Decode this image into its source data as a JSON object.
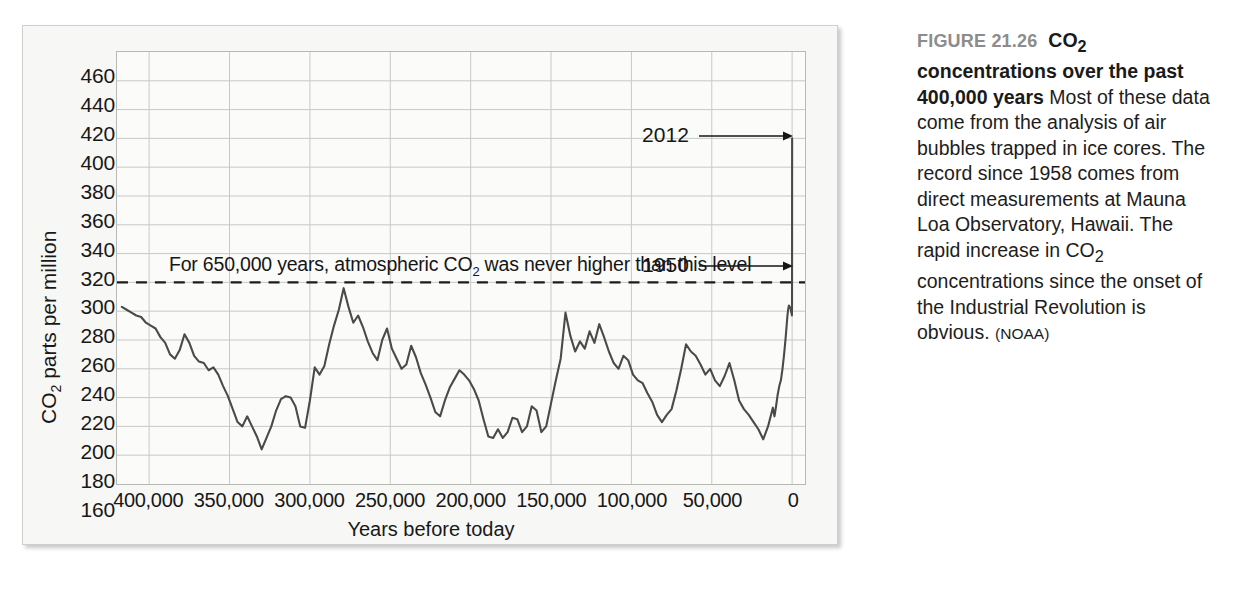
{
  "caption": {
    "figure_number": "FIGURE 21.26",
    "headline_part1": "CO",
    "headline_sub": "2",
    "headline_part2": " concentrations over the past 400,000 years",
    "body_part1": "Most of these data come from the analysis of air bubbles trapped in ice cores. The record since 1958 comes from direct measurements at Mauna Loa Observatory, Hawaii. The rapid increase in CO",
    "body_sub": "2",
    "body_part2": " concentrations since the onset of the Industrial Revolution is obvious.",
    "credit": "(NOAA)"
  },
  "chart_data": {
    "type": "line",
    "title": "",
    "xlabel": "Years before today",
    "ylabel_part1": "CO",
    "ylabel_sub": "2",
    "ylabel_part2": " parts per million",
    "xlim": [
      420000,
      -8000
    ],
    "ylim": [
      160,
      460
    ],
    "ytick_values": [
      460,
      440,
      420,
      400,
      380,
      360,
      340,
      320,
      300,
      280,
      260,
      240,
      220,
      200,
      180,
      160
    ],
    "ytick_labels": [
      "460",
      "440",
      "420",
      "400",
      "380",
      "360",
      "340",
      "320",
      "300",
      "280",
      "260",
      "240",
      "220",
      "200",
      "180",
      "160"
    ],
    "xtick_values": [
      400000,
      350000,
      300000,
      250000,
      200000,
      150000,
      100000,
      50000,
      0
    ],
    "xtick_labels": [
      "400,000",
      "350,000",
      "300,000",
      "250,000",
      "200,000",
      "150,000",
      "100,000",
      "50,000",
      "0"
    ],
    "grid": true,
    "line_color": "#4a4a4a",
    "threshold": {
      "value": 300,
      "style": "dashed",
      "label_part1": "For 650,000 years, atmospheric CO",
      "label_sub": "2",
      "label_part2": " was never higher than this level"
    },
    "annotations": [
      {
        "label": "2012",
        "y_value": 400,
        "x_value": 0
      },
      {
        "label": "1950",
        "y_value": 310,
        "x_value": 0
      }
    ],
    "series": [
      {
        "name": "CO2 concentration",
        "points": [
          [
            417000,
            283
          ],
          [
            414000,
            281
          ],
          [
            411000,
            279
          ],
          [
            408000,
            277
          ],
          [
            405000,
            276
          ],
          [
            402000,
            272
          ],
          [
            399000,
            270
          ],
          [
            396000,
            268
          ],
          [
            393000,
            262
          ],
          [
            390000,
            258
          ],
          [
            387000,
            250
          ],
          [
            384000,
            247
          ],
          [
            381000,
            253
          ],
          [
            378000,
            264
          ],
          [
            375000,
            258
          ],
          [
            372000,
            249
          ],
          [
            369000,
            245
          ],
          [
            366000,
            244
          ],
          [
            363000,
            239
          ],
          [
            360000,
            241
          ],
          [
            357000,
            236
          ],
          [
            354000,
            228
          ],
          [
            351000,
            221
          ],
          [
            348000,
            212
          ],
          [
            345000,
            203
          ],
          [
            342000,
            200
          ],
          [
            339000,
            207
          ],
          [
            336000,
            200
          ],
          [
            333000,
            193
          ],
          [
            330000,
            184
          ],
          [
            327000,
            192
          ],
          [
            324000,
            200
          ],
          [
            321000,
            211
          ],
          [
            318000,
            219
          ],
          [
            315000,
            221
          ],
          [
            312000,
            220
          ],
          [
            309000,
            214
          ],
          [
            306000,
            200
          ],
          [
            303000,
            199
          ],
          [
            300000,
            218
          ],
          [
            297000,
            241
          ],
          [
            294000,
            236
          ],
          [
            291000,
            242
          ],
          [
            288000,
            257
          ],
          [
            285000,
            270
          ],
          [
            282000,
            281
          ],
          [
            279000,
            296
          ],
          [
            276000,
            283
          ],
          [
            273000,
            272
          ],
          [
            270000,
            277
          ],
          [
            267000,
            269
          ],
          [
            264000,
            259
          ],
          [
            261000,
            251
          ],
          [
            258000,
            246
          ],
          [
            255000,
            260
          ],
          [
            252000,
            268
          ],
          [
            249000,
            254
          ],
          [
            246000,
            247
          ],
          [
            243000,
            240
          ],
          [
            240000,
            243
          ],
          [
            237000,
            256
          ],
          [
            234000,
            248
          ],
          [
            231000,
            237
          ],
          [
            228000,
            229
          ],
          [
            225000,
            220
          ],
          [
            222000,
            210
          ],
          [
            219000,
            207
          ],
          [
            216000,
            218
          ],
          [
            213000,
            227
          ],
          [
            210000,
            233
          ],
          [
            207000,
            239
          ],
          [
            204000,
            236
          ],
          [
            201000,
            232
          ],
          [
            198000,
            226
          ],
          [
            195000,
            218
          ],
          [
            192000,
            205
          ],
          [
            189000,
            193
          ],
          [
            186000,
            192
          ],
          [
            183000,
            198
          ],
          [
            180000,
            192
          ],
          [
            177000,
            196
          ],
          [
            174000,
            206
          ],
          [
            171000,
            205
          ],
          [
            168000,
            196
          ],
          [
            165000,
            200
          ],
          [
            162000,
            214
          ],
          [
            159000,
            211
          ],
          [
            156000,
            196
          ],
          [
            153000,
            200
          ],
          [
            150000,
            216
          ],
          [
            147000,
            232
          ],
          [
            144000,
            247
          ],
          [
            141000,
            279
          ],
          [
            138000,
            263
          ],
          [
            135000,
            252
          ],
          [
            132000,
            259
          ],
          [
            129000,
            254
          ],
          [
            126000,
            266
          ],
          [
            123000,
            258
          ],
          [
            120000,
            271
          ],
          [
            117000,
            262
          ],
          [
            114000,
            252
          ],
          [
            111000,
            244
          ],
          [
            108000,
            240
          ],
          [
            105000,
            249
          ],
          [
            102000,
            246
          ],
          [
            99000,
            236
          ],
          [
            96000,
            232
          ],
          [
            93000,
            230
          ],
          [
            90000,
            223
          ],
          [
            87000,
            217
          ],
          [
            84000,
            208
          ],
          [
            81000,
            203
          ],
          [
            78000,
            208
          ],
          [
            75000,
            212
          ],
          [
            72000,
            225
          ],
          [
            69000,
            240
          ],
          [
            66000,
            257
          ],
          [
            63000,
            252
          ],
          [
            60000,
            249
          ],
          [
            57000,
            243
          ],
          [
            54000,
            236
          ],
          [
            51000,
            240
          ],
          [
            48000,
            232
          ],
          [
            45000,
            228
          ],
          [
            42000,
            235
          ],
          [
            39000,
            244
          ],
          [
            36000,
            232
          ],
          [
            33000,
            218
          ],
          [
            30000,
            212
          ],
          [
            27000,
            208
          ],
          [
            24000,
            203
          ],
          [
            21000,
            198
          ],
          [
            18000,
            191
          ],
          [
            15000,
            200
          ],
          [
            12000,
            213
          ],
          [
            11000,
            207
          ],
          [
            10000,
            214
          ],
          [
            9000,
            222
          ],
          [
            8000,
            228
          ],
          [
            7000,
            232
          ],
          [
            6000,
            240
          ],
          [
            5000,
            250
          ],
          [
            4000,
            262
          ],
          [
            3000,
            276
          ],
          [
            2500,
            281
          ],
          [
            2000,
            284
          ],
          [
            1500,
            283
          ],
          [
            1000,
            282
          ],
          [
            800,
            281
          ],
          [
            500,
            279
          ],
          [
            300,
            278
          ],
          [
            200,
            278
          ],
          [
            150,
            277
          ],
          [
            100,
            280
          ],
          [
            80,
            284
          ],
          [
            62,
            288
          ],
          [
            54,
            310
          ],
          [
            40,
            330
          ],
          [
            30,
            350
          ],
          [
            20,
            370
          ],
          [
            10,
            390
          ],
          [
            0,
            400
          ],
          [
            -2,
            400
          ]
        ]
      }
    ]
  }
}
